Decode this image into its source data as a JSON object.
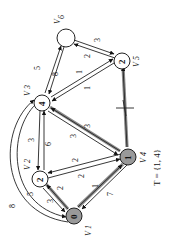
{
  "figure": {
    "title_set": "T = {1, 4}",
    "orientation": "rotated -90deg"
  },
  "nodes": [
    {
      "id": "V1",
      "label": "V1",
      "value": "0",
      "in_tree": true
    },
    {
      "id": "V2",
      "label": "V2",
      "value": "2",
      "in_tree": false
    },
    {
      "id": "V3",
      "label": "V3",
      "value": "4",
      "in_tree": false
    },
    {
      "id": "V4",
      "label": "V4",
      "value": "1",
      "in_tree": true
    },
    {
      "id": "V5",
      "label": "V5",
      "value": "2",
      "in_tree": false
    },
    {
      "id": "V6",
      "label": "V6",
      "value": "",
      "in_tree": false
    }
  ],
  "edges": [
    {
      "from": "V1",
      "to": "V4",
      "weight": "1",
      "highlight": true
    },
    {
      "from": "V4",
      "to": "V1",
      "weight": "7",
      "highlight": false
    },
    {
      "from": "V1",
      "to": "V2",
      "weight": "2",
      "highlight": true
    },
    {
      "from": "V2",
      "to": "V1",
      "weight": "3",
      "highlight": false
    },
    {
      "from": "V1",
      "to": "V3",
      "weight": "5",
      "highlight": false
    },
    {
      "from": "V3",
      "to": "V1",
      "weight": "8",
      "highlight": false
    },
    {
      "from": "V4",
      "to": "V2",
      "weight": "2",
      "highlight": false
    },
    {
      "from": "V2",
      "to": "V4",
      "weight": "2",
      "highlight": false
    },
    {
      "from": "V4",
      "to": "V3",
      "weight": "3",
      "highlight": true
    },
    {
      "from": "V3",
      "to": "V4",
      "weight": "3",
      "highlight": false
    },
    {
      "from": "V4",
      "to": "V5",
      "weight": "1",
      "highlight": true
    },
    {
      "from": "V3",
      "to": "V2",
      "weight": "6",
      "highlight": false
    },
    {
      "from": "V2",
      "to": "V3",
      "weight": "3",
      "highlight": false
    },
    {
      "from": "V3",
      "to": "V5",
      "weight": "1",
      "highlight": false
    },
    {
      "from": "V5",
      "to": "V3",
      "weight": "1",
      "highlight": false
    },
    {
      "from": "V3",
      "to": "V6",
      "weight": "5",
      "highlight": false
    },
    {
      "from": "V6",
      "to": "V3",
      "weight": "8",
      "highlight": false
    },
    {
      "from": "V6",
      "to": "V5",
      "weight": "3",
      "highlight": false
    },
    {
      "from": "V5",
      "to": "V6",
      "weight": "2",
      "highlight": false
    }
  ],
  "labels": {
    "v1": "V",
    "v1_sub": "1",
    "v2": "V",
    "v2_sub": "2",
    "v3": "V",
    "v3_sub": "3",
    "v4": "V",
    "v4_sub": "4",
    "v5": "V",
    "v5_sub": "5",
    "v6": "V",
    "v6_sub": "6",
    "val_v1": "0",
    "val_v2": "2",
    "val_v3": "4",
    "val_v4": "1",
    "val_v5": "2",
    "w_14": "1",
    "w_41": "7",
    "w_12": "2",
    "w_21": "3",
    "w_13": "5",
    "w_31": "8",
    "w_42a": "2",
    "w_42b": "2",
    "w_43a": "3",
    "w_43b": "3",
    "w_45": "1",
    "w_32": "6",
    "w_23": "3",
    "w_35a": "1",
    "w_35b": "1",
    "w_36": "5",
    "w_63": "8",
    "w_65": "3",
    "w_56": "2",
    "tset": "T = {1, 4}"
  }
}
